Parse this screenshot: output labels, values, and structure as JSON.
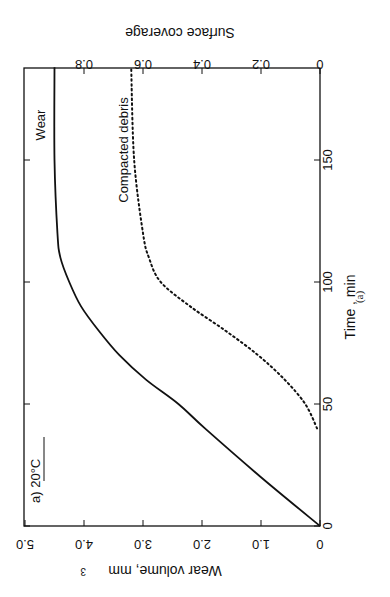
{
  "chart_data": {
    "type": "line",
    "title": "a) 20°C",
    "caption": "(a)",
    "orientation": "rotated 90° counter-clockwise on page",
    "xlabel": "Time , min",
    "x_ticks": [
      0,
      50,
      100,
      150
    ],
    "xlim": [
      0,
      188
    ],
    "ylabel": "Wear volume, mm³",
    "y_ticks": [
      "0",
      "1.0",
      "2.0",
      "3.0",
      "4.0",
      "5.0"
    ],
    "ylim": [
      0,
      5.0
    ],
    "y2label": "Surface coverage",
    "y2_ticks": [
      "0",
      "0.2",
      "0.4",
      "0.6",
      "0.8"
    ],
    "y2lim": [
      0,
      1.0
    ],
    "grid": false,
    "series": [
      {
        "name": "Wear",
        "axis": "left",
        "style": "solid",
        "x": [
          0,
          20,
          40,
          50,
          60,
          70,
          80,
          90,
          100,
          110,
          120,
          150,
          188
        ],
        "values": [
          0,
          1.0,
          1.95,
          2.4,
          2.95,
          3.4,
          3.75,
          4.05,
          4.25,
          4.4,
          4.45,
          4.5,
          4.5
        ]
      },
      {
        "name": "Compacted debris",
        "axis": "right",
        "style": "dotted",
        "x": [
          40,
          50,
          60,
          70,
          80,
          90,
          100,
          110,
          120,
          150,
          188
        ],
        "values": [
          0.01,
          0.05,
          0.12,
          0.21,
          0.32,
          0.44,
          0.54,
          0.58,
          0.6,
          0.63,
          0.64
        ]
      }
    ]
  },
  "labels": {
    "panel": "a) 20°C",
    "wear_label": "Wear",
    "debris_label": "Compacted debris",
    "time_axis": "Time , min",
    "wear_axis": "Wear volume, mm",
    "wear_axis_sup": "3",
    "coverage_axis": "Surface coverage",
    "caption": "(a)"
  }
}
